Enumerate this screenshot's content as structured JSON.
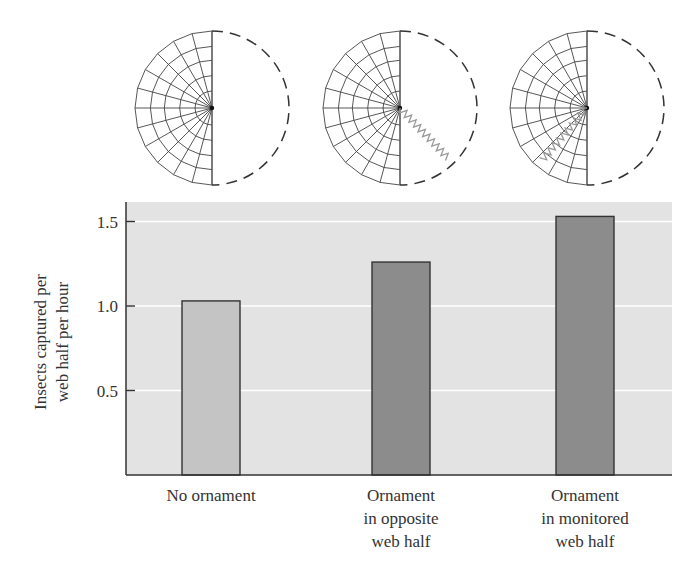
{
  "chart_data": {
    "type": "bar",
    "title": "",
    "xlabel": "",
    "ylabel": "Insects captured per web half per hour",
    "ylabel_lines": [
      "Insects captured per",
      "web half per hour"
    ],
    "categories": [
      "No ornament",
      "Ornament in opposite web half",
      "Ornament in monitored web half"
    ],
    "category_label_lines": [
      [
        "No ornament"
      ],
      [
        "Ornament",
        "in opposite",
        "web half"
      ],
      [
        "Ornament",
        "in monitored",
        "web half"
      ]
    ],
    "values": [
      1.03,
      1.26,
      1.53
    ],
    "ylim": [
      0,
      1.6
    ],
    "yticks": [
      0.5,
      1.0,
      1.5
    ],
    "ytick_labels": [
      "0.5",
      "1.0",
      "1.5"
    ],
    "grid": true,
    "legend": null,
    "bar_colors": [
      "#c4c4c4",
      "#8c8c8c",
      "#8c8c8c"
    ],
    "plot_background": "#e3e3e3",
    "gridline_color": "#ffffff",
    "illustrations": [
      {
        "category": "No ornament",
        "ornament": "none"
      },
      {
        "category": "Ornament in opposite web half",
        "ornament": "right-half (unmonitored side)"
      },
      {
        "category": "Ornament in monitored web half",
        "ornament": "left-half (monitored side)"
      }
    ]
  },
  "webs": [
    {
      "cx": 212,
      "cy": 108,
      "ornament": null
    },
    {
      "cx": 400,
      "cy": 108,
      "ornament": {
        "x2": 448,
        "y2": 158
      }
    },
    {
      "cx": 587,
      "cy": 108,
      "ornament": {
        "x2": 542,
        "y2": 160
      }
    }
  ],
  "layout": {
    "plot": {
      "left": 126,
      "right": 672,
      "top": 202,
      "bottom": 475
    },
    "px_per_unit": 169,
    "bar_left": [
      182,
      372,
      556
    ],
    "bar_width": 58,
    "web_radius": 77
  }
}
